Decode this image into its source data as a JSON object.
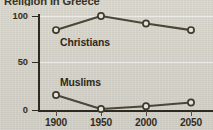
{
  "chart_data": {
    "type": "line",
    "title": "Religion in Greece",
    "xlabel": "",
    "ylabel": "",
    "x": [
      1900,
      1950,
      2000,
      2050
    ],
    "categories": [
      "1900",
      "1950",
      "2000",
      "2050"
    ],
    "series": [
      {
        "name": "Christians",
        "values": [
          85,
          100,
          92,
          85
        ]
      },
      {
        "name": "Muslims",
        "values": [
          16,
          1,
          4,
          8
        ]
      }
    ],
    "xlim": [
      1880,
      2070
    ],
    "ylim": [
      0,
      100
    ],
    "yticks": [
      0,
      50,
      100
    ],
    "ytick_labels": [
      "0",
      "50",
      "100"
    ],
    "xticks": [
      1900,
      1950,
      2000,
      2050
    ],
    "xtick_labels": [
      "1900",
      "1950",
      "2000",
      "2050"
    ],
    "grid": true,
    "legend_position": "inline-labels",
    "markers": "open-circle",
    "colors": {
      "line": "#4c4638",
      "marker_fill": "#e4e1d8",
      "marker_stroke": "#3e3a2e",
      "axis": "#2f2a20",
      "text": "#322c1f",
      "background": "#d6d3ca",
      "gridline": "#ffffff"
    },
    "annotations": [
      {
        "text": "Christians",
        "series": "Christians"
      },
      {
        "text": "Muslims",
        "series": "Muslims"
      }
    ]
  },
  "axis": {
    "y_labels": [
      "100",
      "50",
      "0"
    ],
    "x_labels": [
      "1900",
      "1950",
      "2000",
      "2050"
    ]
  },
  "labels": {
    "christians": "Christians",
    "muslims": "Muslims"
  },
  "title": "Religion in Greece"
}
